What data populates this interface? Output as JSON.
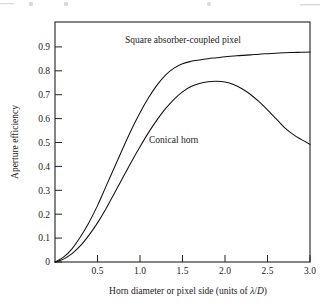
{
  "chart_data": {
    "type": "line",
    "title": "",
    "xlabel": "Horn diameter or pixel side (units of λ/D)",
    "xlabel_plain": "Horn diameter or pixel side (units of ",
    "xlabel_lambda": "λ",
    "xlabel_slash": "/",
    "xlabel_D": "D",
    "xlabel_close": ")",
    "ylabel": "Aperture efficiency",
    "xlim": [
      0,
      3.0
    ],
    "ylim": [
      0,
      1.0
    ],
    "xticks": [
      0.5,
      1.0,
      1.5,
      2.0,
      2.5,
      3.0
    ],
    "xtick_labels": [
      "0.5",
      "1.0",
      "1.5",
      "2.0",
      "2.5",
      "3.0"
    ],
    "yticks": [
      0,
      0.1,
      0.2,
      0.3,
      0.4,
      0.5,
      0.6,
      0.7,
      0.8,
      0.9
    ],
    "ytick_labels": [
      "0",
      "0.1",
      "0.2",
      "0.3",
      "0.4",
      "0.5",
      "0.6",
      "0.7",
      "0.8",
      "0.9"
    ],
    "grid": false,
    "legend_position": "inline-annotations",
    "x": [
      0.0,
      0.1,
      0.2,
      0.3,
      0.4,
      0.5,
      0.6,
      0.7,
      0.8,
      0.9,
      1.0,
      1.1,
      1.2,
      1.3,
      1.4,
      1.5,
      1.6,
      1.7,
      1.8,
      1.9,
      2.0,
      2.1,
      2.2,
      2.3,
      2.4,
      2.5,
      2.6,
      2.7,
      2.8,
      2.9,
      3.0
    ],
    "series": [
      {
        "name": "Square absorber-coupled pixel",
        "values": [
          0.0,
          0.02,
          0.055,
          0.105,
          0.165,
          0.235,
          0.315,
          0.395,
          0.475,
          0.552,
          0.622,
          0.684,
          0.737,
          0.779,
          0.808,
          0.826,
          0.836,
          0.842,
          0.847,
          0.851,
          0.855,
          0.858,
          0.861,
          0.863,
          0.866,
          0.868,
          0.87,
          0.872,
          0.873,
          0.874,
          0.875
        ]
      },
      {
        "name": "Conical horn",
        "values": [
          0.0,
          0.012,
          0.035,
          0.068,
          0.112,
          0.163,
          0.222,
          0.287,
          0.353,
          0.418,
          0.48,
          0.539,
          0.592,
          0.639,
          0.678,
          0.709,
          0.731,
          0.744,
          0.751,
          0.753,
          0.75,
          0.74,
          0.722,
          0.698,
          0.668,
          0.634,
          0.597,
          0.56,
          0.532,
          0.51,
          0.49
        ]
      }
    ],
    "annotations": [
      {
        "text": "Square absorber-coupled pixel",
        "x": 1.0,
        "y": 0.905
      },
      {
        "text": "Conical horn",
        "x": 1.45,
        "y": 0.515
      }
    ]
  }
}
